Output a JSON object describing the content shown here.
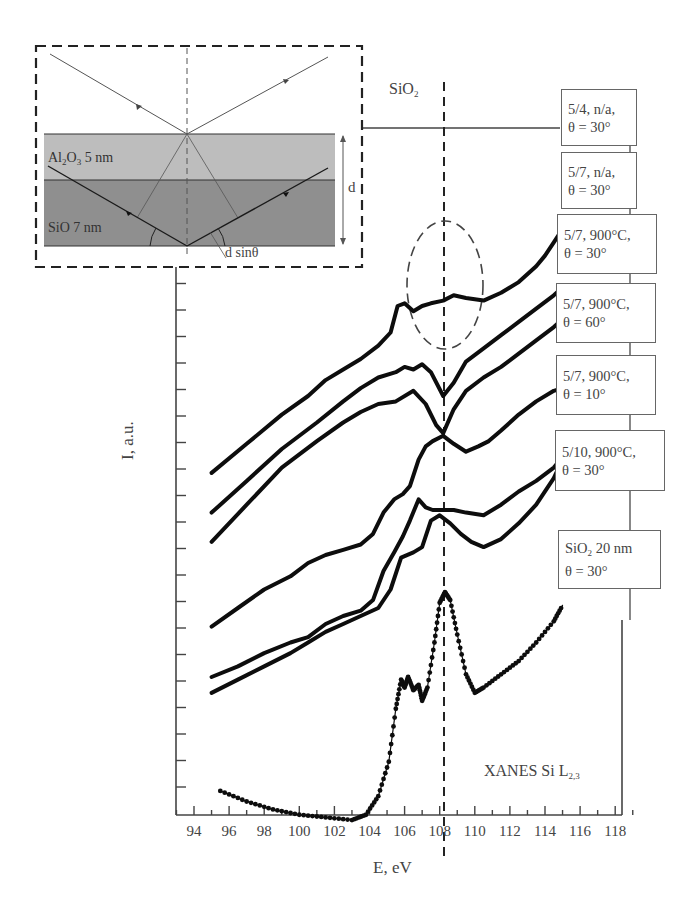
{
  "chart_data": {
    "type": "line",
    "title": "XANES Si L2,3",
    "xlabel": "E, eV",
    "ylabel": "I, a.u.",
    "xlim": [
      93,
      119
    ],
    "xticks": [
      94,
      96,
      98,
      100,
      102,
      104,
      106,
      108,
      110,
      112,
      114,
      116,
      118
    ],
    "yticks_labeled": false,
    "grid": false,
    "reference_line": {
      "label": "SiO2",
      "x": 108.2,
      "style": "dashed"
    },
    "highlight": {
      "shape": "dashed-ellipse",
      "around_x": 108.2,
      "note": "dip at SiO2 energy in 900°C, θ=30° and θ=60° curves"
    },
    "series": [
      {
        "name": "5/4, n/a, θ = 30°",
        "x": [
          95,
          97,
          99,
          100.5,
          101.5,
          102.5,
          103.5,
          104.5,
          105.2,
          105.6,
          106,
          106.5,
          107,
          107.5,
          108.2,
          108.8,
          109.5,
          110.5,
          111.5,
          112.5,
          113.5,
          114,
          114.5,
          115
        ],
        "y": [
          9.4,
          10.5,
          11.6,
          12.3,
          12.9,
          13.3,
          13.7,
          14.2,
          14.7,
          15.7,
          15.8,
          15.5,
          15.7,
          15.8,
          15.9,
          16.1,
          16,
          15.9,
          16.2,
          16.6,
          17.2,
          17.6,
          18.1,
          18.6
        ]
      },
      {
        "name": "5/7, n/a, θ = 30°",
        "x": [
          95,
          97,
          99,
          101,
          102.5,
          103.5,
          104.5,
          105.5,
          106,
          106.5,
          107,
          107.5,
          108.2,
          108.8,
          109.5,
          110.5,
          111.5,
          112.5,
          113.5,
          114.5,
          115
        ],
        "y": [
          7.9,
          9.1,
          10.3,
          11.3,
          12.1,
          12.6,
          13,
          13.2,
          13.4,
          13.3,
          13.5,
          13.2,
          12.3,
          12.8,
          13.6,
          14.1,
          14.6,
          15.1,
          15.6,
          16.1,
          16.4
        ]
      },
      {
        "name": "5/7, 900°C, θ = 30°",
        "x": [
          95,
          97,
          99,
          101,
          102.5,
          103.5,
          104.5,
          105.5,
          106.5,
          107.2,
          107.8,
          108.2,
          108.8,
          109.5,
          110.5,
          111.5,
          112.5,
          113.5,
          114.5,
          115
        ],
        "y": [
          6.8,
          8.2,
          9.6,
          10.6,
          11.3,
          11.7,
          12,
          12.1,
          12.5,
          12,
          11.2,
          10.9,
          11.8,
          12.5,
          13,
          13.4,
          13.9,
          14.4,
          14.9,
          15.2
        ]
      },
      {
        "name": "5/7, 900°C, θ = 60°",
        "x": [
          95,
          96.5,
          98,
          99.5,
          100.5,
          101.5,
          102.5,
          103.5,
          104.2,
          104.8,
          105.4,
          105.9,
          106.3,
          106.8,
          107.2,
          107.6,
          108.2,
          108.8,
          109.5,
          110.2,
          110.8,
          111.5,
          112.5,
          113.5,
          114.5,
          115
        ],
        "y": [
          3.6,
          4.3,
          5,
          5.5,
          6,
          6.3,
          6.5,
          6.7,
          7.1,
          7.9,
          8.4,
          8.6,
          8.9,
          9.9,
          10.4,
          10.6,
          10.8,
          10.5,
          10.2,
          10.4,
          10.6,
          11,
          11.6,
          12.1,
          12.5,
          12.6
        ]
      },
      {
        "name": "5/7, 900°C, θ = 10°",
        "x": [
          95,
          96.5,
          98,
          99.5,
          100.5,
          101.5,
          102.5,
          103.5,
          104.2,
          104.8,
          105.4,
          105.9,
          106.3,
          106.8,
          107.2,
          107.6,
          108.2,
          108.8,
          109.5,
          110.5,
          111.5,
          112.5,
          113.5,
          114.5,
          115
        ],
        "y": [
          1.7,
          2.1,
          2.6,
          3,
          3.2,
          3.7,
          4,
          4.2,
          4.6,
          5.7,
          6.4,
          7,
          7.6,
          8.4,
          8.1,
          8,
          8,
          8,
          7.9,
          7.8,
          8.2,
          8.7,
          9.1,
          9.6,
          10
        ]
      },
      {
        "name": "5/10, 900°C, θ = 30°",
        "x": [
          95,
          96.5,
          98,
          99.5,
          100.5,
          101.5,
          102.5,
          103.5,
          104.5,
          105.2,
          105.8,
          106.5,
          107,
          107.5,
          108,
          108.6,
          109.2,
          109.8,
          110.5,
          111.5,
          112.5,
          113.5,
          114.5,
          115
        ],
        "y": [
          1.1,
          1.6,
          2.1,
          2.6,
          3,
          3.4,
          3.7,
          4,
          4.3,
          5,
          6.2,
          6.4,
          6.6,
          7.6,
          7.8,
          7.5,
          7.1,
          6.8,
          6.6,
          6.9,
          7.5,
          8.2,
          9.2,
          9.9
        ]
      },
      {
        "name": "SiO2 20 nm, θ = 30°",
        "x": [
          95.5,
          97,
          98.5,
          100,
          101.5,
          103,
          103.8,
          104.5,
          105.1,
          105.5,
          105.8,
          106,
          106.2,
          106.5,
          106.8,
          107,
          107.3,
          107.7,
          108,
          108.3,
          108.6,
          109,
          109.5,
          110,
          110.5,
          111.5,
          112.5,
          113.5,
          114.5,
          115
        ],
        "y": [
          -2.6,
          -3,
          -3.3,
          -3.5,
          -3.6,
          -3.7,
          -3.5,
          -2.8,
          -1.5,
          0.5,
          1.6,
          1.3,
          1.7,
          1.2,
          1.4,
          0.8,
          1.3,
          3,
          4.5,
          4.9,
          4.6,
          3.3,
          1.8,
          1.1,
          1.3,
          1.8,
          2.3,
          3,
          3.8,
          4.4
        ]
      }
    ]
  },
  "axis": {
    "x_title": "E, eV",
    "y_title": "I, a.u.",
    "x_tick_labels": [
      "94",
      "96",
      "98",
      "100",
      "102",
      "104",
      "106",
      "108",
      "110",
      "112",
      "114",
      "116",
      "118"
    ]
  },
  "annotations": {
    "sio2_label": "SiO",
    "sio2_sub": "2",
    "xanes_label": "XANES Si L",
    "xanes_sub": "2,3"
  },
  "legend_boxes": [
    {
      "line1": "5/4, n/a,",
      "line2": "θ = 30°"
    },
    {
      "line1": "5/7, n/a,",
      "line2": "θ = 30°"
    },
    {
      "line1": "5/7, 900°C,",
      "line2": "θ = 30°"
    },
    {
      "line1": "5/7, 900°C,",
      "line2": "θ = 60°"
    },
    {
      "line1": "5/7, 900°C,",
      "line2": "θ = 10°"
    },
    {
      "line1": "5/10, 900°C,",
      "line2": "θ = 30°"
    },
    {
      "line1_main": "SiO",
      "line1_sub": "2",
      "line1_rest": " 20 nm",
      "line2": "θ = 30°"
    }
  ],
  "inset": {
    "layer_top_label_main": "Al",
    "layer_top_label_sub1": "2",
    "layer_top_label_mid": "O",
    "layer_top_label_sub2": "3",
    "layer_top_label_rest": " 5 nm",
    "layer_bottom_label": "SiO 7 nm",
    "thickness_label": "d",
    "path_label": "d sinθ",
    "colors": {
      "top_layer": "#bdbdbd",
      "bottom_layer": "#8f8f8f"
    }
  }
}
